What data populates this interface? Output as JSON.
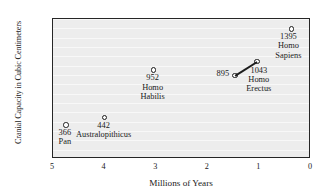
{
  "chart_data": {
    "type": "scatter",
    "title": "",
    "xlabel": "Millions of Years",
    "ylabel": "Cranial Capacity in Cubic Centimeters",
    "xlim": [
      5,
      0
    ],
    "ylim": [
      0,
      1500
    ],
    "x_inverted": true,
    "grid": true,
    "legend": "none",
    "y_ticks": [
      0,
      100,
      200,
      300,
      400,
      500,
      600,
      700,
      800,
      900,
      1000,
      1100,
      1200,
      1300,
      1400,
      1500
    ],
    "x_ticks": [
      5,
      4,
      3,
      2,
      1,
      0
    ],
    "points": [
      {
        "name": "Pan",
        "x": 4.75,
        "y": 366,
        "label_value": "366",
        "label_name_line1": "Pan",
        "label_name_line2": ""
      },
      {
        "name": "Australopithicus",
        "x": 4.0,
        "y": 442,
        "label_value": "442",
        "label_name_line1": "Australopithicus",
        "label_name_line2": ""
      },
      {
        "name": "Homo Habilis",
        "x": 3.05,
        "y": 952,
        "label_value": "952",
        "label_name_line1": "Homo",
        "label_name_line2": "Habilis"
      },
      {
        "name": "Homo Erectus A",
        "x": 1.47,
        "y": 895,
        "label_value": "895",
        "label_name_line1": "",
        "label_name_line2": ""
      },
      {
        "name": "Homo Erectus B",
        "x": 1.05,
        "y": 1043,
        "label_value": "1043",
        "label_name_line1": "Homo",
        "label_name_line2": "Erectus"
      },
      {
        "name": "Homo Sapiens",
        "x": 0.38,
        "y": 1395,
        "label_value": "1395",
        "label_name_line1": "Homo",
        "label_name_line2": "Sapiens"
      }
    ],
    "connections": [
      {
        "from": "Homo Erectus A",
        "to": "Homo Erectus B"
      }
    ],
    "colors": {
      "plot_background": "#ededed",
      "gridline": "#f8f8f8",
      "axis": "#262626",
      "marker_edge": "#1c1c1c",
      "marker_fill": "#ffffff",
      "text": "#1a1a1a"
    }
  },
  "annotations": {
    "pan": {
      "value": "366",
      "line1": "Pan"
    },
    "australopithicus": {
      "value": "442",
      "line1": "Australopithicus"
    },
    "habilis": {
      "value": "952",
      "line1": "Homo",
      "line2": "Habilis"
    },
    "erectus_a": {
      "value": "895"
    },
    "erectus_b": {
      "value": "1043",
      "line1": "Homo",
      "line2": "Erectus"
    },
    "sapiens": {
      "value": "1395",
      "line1": "Homo",
      "line2": "Sapiens"
    }
  },
  "axis_titles": {
    "x": "Millions of Years",
    "y": "Cranial Capacity in Cubic Centimeters"
  }
}
